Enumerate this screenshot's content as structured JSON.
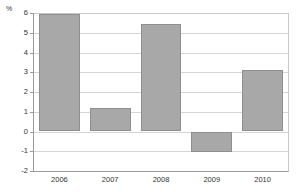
{
  "chart_data": {
    "type": "bar",
    "title": "",
    "subtitle": "",
    "xlabel": "",
    "ylabel": "%",
    "unit_label": "%",
    "categories": [
      "2006",
      "2007",
      "2008",
      "2009",
      "2010"
    ],
    "values": [
      5.95,
      1.2,
      5.45,
      -1.05,
      3.1
    ],
    "series": [
      {
        "name": "",
        "values": [
          5.95,
          1.2,
          5.45,
          -1.05,
          3.1
        ]
      }
    ],
    "ylim": [
      -2,
      6
    ],
    "yticks": [
      6,
      5,
      4,
      3,
      2,
      1,
      0,
      -1,
      -2
    ],
    "ytick_labels": [
      "6",
      "5",
      "4",
      "3",
      "2",
      "1",
      "0",
      "-1",
      "-2"
    ],
    "grid": true,
    "grid_axis": "y",
    "legend": false,
    "legend_position": "none",
    "annotations": [],
    "colors": {
      "bar_fill": "#a8a8a8",
      "bar_border": "#8f8f8f",
      "gridline": "#d6d6d6",
      "axis": "#9a9a9a",
      "text": "#333333",
      "background": "#ffffff"
    }
  }
}
